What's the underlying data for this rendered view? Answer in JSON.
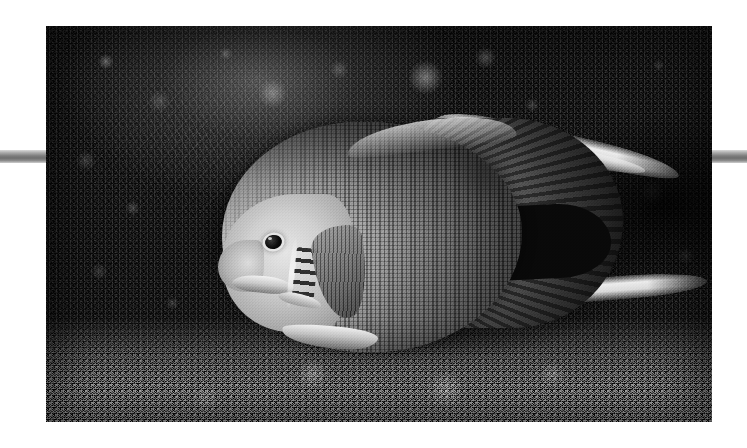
{
  "page": {
    "background_color": "#ffffff",
    "width": 747,
    "height": 448
  },
  "rules": {
    "color": "#7d7d7d",
    "left": {
      "name": "left-rule-bar"
    },
    "right": {
      "name": "right-rule-bar"
    }
  },
  "photo": {
    "kind": "black-and-white underwater photograph",
    "subject": "grey angelfish",
    "setting": "dark coral reef ledge",
    "left": 46,
    "top": 26,
    "width": 666,
    "height": 396,
    "palette": {
      "darkest": "#050505",
      "rock_mid": "#3a3a3a",
      "rock_light": "#8a8a8a",
      "fish_body_light": "#d7d7d7",
      "fish_body_mid": "#8e8e8e",
      "fish_body_dark": "#3d3d3d",
      "fin_highlight": "#f8f8f8",
      "rubble_bright": "#e8e8e8"
    },
    "regions": {
      "background_rock": "dark mottled coral rock filling the frame",
      "rubble_band": "bright granular coral rubble along the bottom edge",
      "cave_shadow": "deep black shadow behind and right of the fish"
    },
    "fish_parts": {
      "body": "oval scaled disc body",
      "head": "pale unscaled head",
      "eye": "dark round eye with bright ring",
      "gill_bars": "row of short dark bars on the gill cover",
      "pectoral_fin": "dark rayed fin behind the gill",
      "pelvic_fin": "pale fin on the lower front belly",
      "caudal_fin": "large dark rayed tail fan",
      "dorsal_filament": "long bright filament trailing up and right",
      "anal_filament": "long bright filament trailing right"
    }
  }
}
